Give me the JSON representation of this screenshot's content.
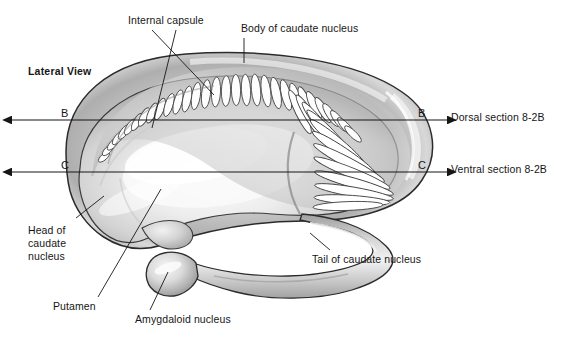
{
  "figure": {
    "title_note": "Lateral view of the corpus striatum (caudate nucleus, putamen, amygdala)",
    "view_label": "Lateral View",
    "background_color": "#ffffff",
    "ink_color": "#161616",
    "fill_light": "#f2f2f2",
    "fill_mid": "#c4c4c4",
    "fill_dark": "#8f8f8f",
    "outline_color": "#2b2b2b"
  },
  "labels": {
    "lateral_view": "Lateral View",
    "internal_capsule": "Internal capsule",
    "body_of_caudate_nucleus": "Body of caudate nucleus",
    "head_of_caudate_nucleus": "Head of\ncaudate\nnucleus",
    "head_line1": "Head of",
    "head_line2": "caudate",
    "head_line3": "nucleus",
    "putamen": "Putamen",
    "amygdaloid_nucleus": "Amygdaloid nucleus",
    "tail_of_caudate_nucleus": "Tail of caudate nucleus"
  },
  "section_lines": [
    {
      "id": "B",
      "mark_left": "B",
      "mark_right": "B",
      "caption": "Dorsal section 8-2B",
      "y": 120,
      "x_start": 12,
      "x_end": 447
    },
    {
      "id": "C",
      "mark_left": "C",
      "mark_right": "C",
      "caption": "Ventral section 8-2B",
      "y": 172,
      "x_start": 12,
      "x_end": 447
    }
  ],
  "callouts": [
    {
      "name": "internal-capsule-a",
      "label": "Internal capsule",
      "target_x": 168,
      "target_y": 95
    },
    {
      "name": "internal-capsule-b",
      "label": "Internal capsule",
      "target_x": 213,
      "target_y": 82
    },
    {
      "name": "body-of-caudate",
      "label": "Body of caudate nucleus",
      "target_x": 244,
      "target_y": 62
    },
    {
      "name": "head-of-caudate",
      "label": "Head of caudate nucleus",
      "target_x": 100,
      "target_y": 202
    },
    {
      "name": "putamen",
      "label": "Putamen",
      "target_x": 159,
      "target_y": 190
    },
    {
      "name": "amygdaloid-nucleus",
      "label": "Amygdaloid nucleus",
      "target_x": 167,
      "target_y": 276
    },
    {
      "name": "tail-of-caudate",
      "label": "Tail of caudate nucleus",
      "target_x": 307,
      "target_y": 240
    }
  ]
}
